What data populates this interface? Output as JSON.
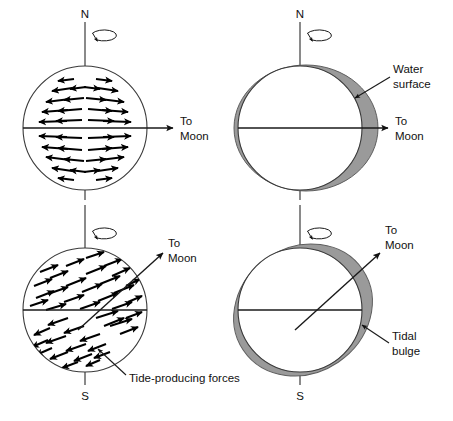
{
  "figure": {
    "colors": {
      "bulge_gray": "#9a9a9a",
      "bulge_outline": "#5e5e5e",
      "globe_outline": "#3a3a3a",
      "ink": "#111111",
      "background": "#ffffff"
    }
  },
  "panels": [
    {
      "id": "top-left",
      "name": "tide-producing-forces-upright",
      "pole_north": "N",
      "pole_south": "",
      "moon_label_line1": "To",
      "moon_label_line2": "Moon",
      "moon_direction": "horizontal-right",
      "axis_tilt_deg": 0,
      "shows": "force-vectors"
    },
    {
      "id": "top-right",
      "name": "water-surface-upright",
      "pole_north": "N",
      "pole_south": "",
      "moon_label_line1": "To",
      "moon_label_line2": "Moon",
      "moon_direction": "horizontal-right",
      "axis_tilt_deg": 0,
      "shows": "water-surface-ellipse",
      "callout_line1": "Water",
      "callout_line2": "surface"
    },
    {
      "id": "bottom-left",
      "name": "tide-producing-forces-tilted",
      "pole_north": "",
      "pole_south": "S",
      "moon_label_line1": "To",
      "moon_label_line2": "Moon",
      "moon_direction": "diagonal-upper-right",
      "axis_tilt_deg": 0,
      "shows": "force-vectors-tilted",
      "callout_line1": "Tide-producing forces"
    },
    {
      "id": "bottom-right",
      "name": "tidal-bulge-tilted",
      "pole_north": "",
      "pole_south": "S",
      "moon_label_line1": "To",
      "moon_label_line2": "Moon",
      "moon_direction": "diagonal-upper-right",
      "axis_tilt_deg": 0,
      "shows": "tidal-bulge-ellipse-tilted",
      "callout_line1": "Tidal",
      "callout_line2": "bulge"
    }
  ],
  "labels": {
    "north": "N",
    "south": "S",
    "to": "To",
    "moon": "Moon",
    "water": "Water",
    "surface": "surface",
    "tidal": "Tidal",
    "bulge": "bulge",
    "tide_producing_forces": "Tide-producing forces"
  }
}
